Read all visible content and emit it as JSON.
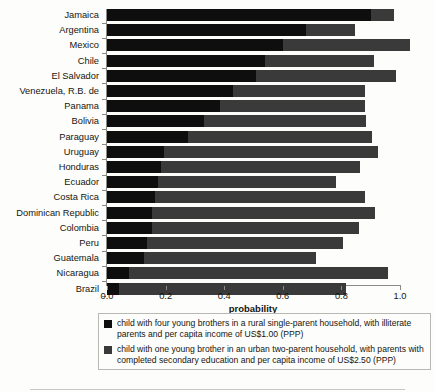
{
  "chart_data": {
    "type": "bar",
    "orientation": "horizontal",
    "stacked": true,
    "title": "",
    "xlabel": "probability",
    "ylabel": "",
    "xlim": [
      0.0,
      1.0
    ],
    "xticks": [
      "0.0",
      "0.2",
      "0.4",
      "0.6",
      "0.8",
      "1.0"
    ],
    "xtick_values": [
      0.0,
      0.2,
      0.4,
      0.6,
      0.8,
      1.0
    ],
    "grid": false,
    "legend_position": "bottom",
    "categories": [
      "Jamaica",
      "Argentina",
      "Mexico",
      "Chile",
      "El Salvador",
      "Venezuela, R.B. de",
      "Panama",
      "Bolivia",
      "Paraguay",
      "Uruguay",
      "Honduras",
      "Ecuador",
      "Costa Rica",
      "Dominican Republic",
      "Colombia",
      "Peru",
      "Guatemala",
      "Nicaragua",
      "Brazil"
    ],
    "series": [
      {
        "name": "child with four young brothers in a rural single-parent household, with illiterate parents and per capita income of US$1.00 (PPP)",
        "color": "#0e0e0e",
        "values": [
          0.9,
          0.68,
          0.6,
          0.54,
          0.51,
          0.43,
          0.385,
          0.33,
          0.275,
          0.195,
          0.185,
          0.175,
          0.165,
          0.155,
          0.155,
          0.135,
          0.125,
          0.075,
          0.04
        ]
      },
      {
        "name": "child with one young brother in an urban two-parent household, with parents with completed secondary education and per capita income of US$2.50 (PPP)",
        "color": "#3a3a3a",
        "values": [
          0.08,
          0.165,
          0.435,
          0.37,
          0.475,
          0.45,
          0.495,
          0.555,
          0.63,
          0.73,
          0.68,
          0.605,
          0.715,
          0.76,
          0.705,
          0.67,
          0.59,
          0.885,
          0.775
        ]
      }
    ],
    "totals": [
      0.98,
      0.845,
      1.035,
      0.91,
      0.985,
      0.88,
      0.88,
      0.885,
      0.905,
      0.925,
      0.865,
      0.78,
      0.88,
      0.915,
      0.86,
      0.805,
      0.715,
      0.96,
      0.815
    ]
  },
  "axis": {
    "x_title": "probability"
  },
  "legend": {
    "entries": [
      {
        "swatch": "dark",
        "text": "child with four young brothers in a rural single-parent household, with illiterate parents and per capita income of US$1.00 (PPP)"
      },
      {
        "swatch": "mid",
        "text": "child with one young brother in an urban two-parent household, with parents with completed secondary education and per capita income of US$2.50 (PPP)"
      }
    ]
  }
}
